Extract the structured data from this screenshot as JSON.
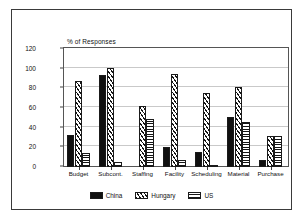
{
  "chart_data": {
    "type": "bar",
    "title": "",
    "ylabel": "% of Responses",
    "xlabel": "",
    "ylim": [
      0,
      120
    ],
    "yticks": [
      0,
      20,
      40,
      60,
      80,
      100,
      120
    ],
    "grid": true,
    "legend_position": "bottom",
    "categories": [
      "Budget",
      "Subcont.",
      "Staffing",
      "Facility",
      "Scheduling",
      "Material",
      "Purchase"
    ],
    "series": [
      {
        "name": "China",
        "pattern": "solid-black",
        "values": [
          32,
          93,
          0,
          20,
          15,
          50,
          7
        ]
      },
      {
        "name": "Hungary",
        "pattern": "diagonal-hatch",
        "values": [
          87,
          100,
          62,
          94,
          75,
          81,
          31
        ]
      },
      {
        "name": "US",
        "pattern": "cross-hatch",
        "values": [
          14,
          5,
          48,
          7,
          2,
          45,
          31
        ]
      }
    ]
  },
  "axis": {
    "title": "% of Responses",
    "tick_labels": [
      "0",
      "20",
      "40",
      "60",
      "80",
      "100",
      "120"
    ]
  },
  "legend": {
    "items": [
      {
        "label": "China"
      },
      {
        "label": "Hungary"
      },
      {
        "label": "US"
      }
    ]
  },
  "colors": {
    "ink": "#101010",
    "grid": "#c9c9c9",
    "frame": "#3a3a3a",
    "plot_border": "#555555",
    "background": "#ffffff"
  }
}
